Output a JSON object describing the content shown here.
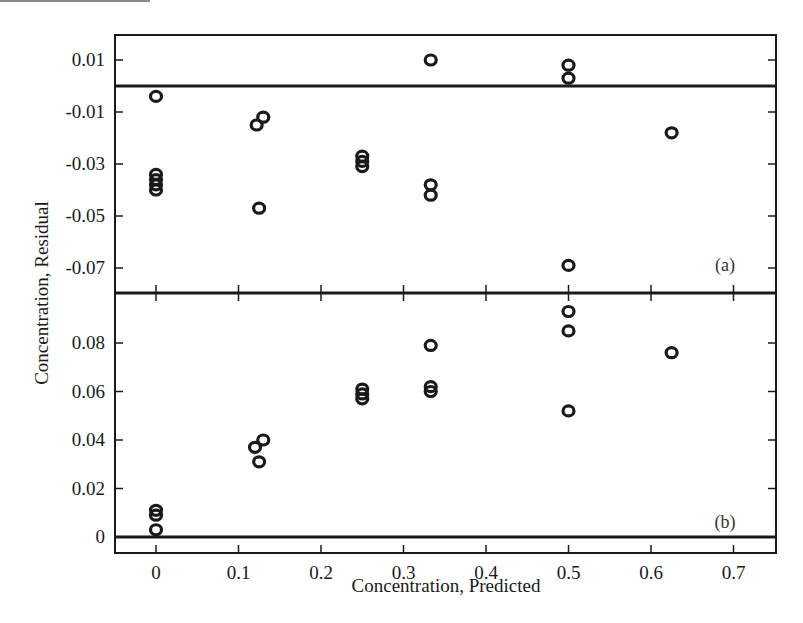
{
  "chart_data": [
    {
      "type": "scatter",
      "panel": "(a)",
      "title": "",
      "xlabel": "Concentration, Predicted",
      "ylabel": "Concentration, Residual",
      "xlim": [
        -0.05,
        0.75
      ],
      "ylim": [
        -0.08,
        0.019
      ],
      "x_ticks": [
        0,
        0.1,
        0.2,
        0.3,
        0.4,
        0.5,
        0.6,
        0.7
      ],
      "y_ticks": [
        0.01,
        -0.01,
        -0.03,
        -0.05,
        -0.07
      ],
      "y_tick_labels": [
        "0.01",
        "-0.01",
        "-0.03",
        "-0.05",
        "-0.07"
      ],
      "reference_line_y": 0,
      "grid": false,
      "marker": "open circle",
      "points": [
        {
          "x": 0,
          "y": -0.004
        },
        {
          "x": 0,
          "y": -0.034
        },
        {
          "x": 0,
          "y": -0.036
        },
        {
          "x": 0,
          "y": -0.038
        },
        {
          "x": 0,
          "y": -0.04
        },
        {
          "x": 0.122,
          "y": -0.015
        },
        {
          "x": 0.13,
          "y": -0.012
        },
        {
          "x": 0.125,
          "y": -0.047
        },
        {
          "x": 0.25,
          "y": -0.027
        },
        {
          "x": 0.25,
          "y": -0.029
        },
        {
          "x": 0.25,
          "y": -0.031
        },
        {
          "x": 0.333,
          "y": 0.01
        },
        {
          "x": 0.333,
          "y": -0.038
        },
        {
          "x": 0.333,
          "y": -0.042
        },
        {
          "x": 0.5,
          "y": 0.008
        },
        {
          "x": 0.5,
          "y": 0.003
        },
        {
          "x": 0.5,
          "y": -0.069
        },
        {
          "x": 0.625,
          "y": -0.018
        }
      ]
    },
    {
      "type": "scatter",
      "panel": "(b)",
      "title": "",
      "xlabel": "Concentration, Predicted",
      "ylabel": "Concentration, Residual",
      "xlim": [
        -0.05,
        0.75
      ],
      "ylim": [
        -0.007,
        0.1
      ],
      "x_ticks": [
        0,
        0.1,
        0.2,
        0.3,
        0.4,
        0.5,
        0.6,
        0.7
      ],
      "x_tick_labels": [
        "0",
        "0.1",
        "0.2",
        "0.3",
        "0.4",
        "0.5",
        "0.6",
        "0.7"
      ],
      "y_ticks": [
        0,
        0.02,
        0.04,
        0.06,
        0.08
      ],
      "y_tick_labels": [
        "0",
        "0.02",
        "0.04",
        "0.06",
        "0.08"
      ],
      "reference_line_y": 0,
      "grid": false,
      "marker": "open circle",
      "points": [
        {
          "x": 0,
          "y": 0.011
        },
        {
          "x": 0,
          "y": 0.009
        },
        {
          "x": 0,
          "y": 0.003
        },
        {
          "x": 0.12,
          "y": 0.037
        },
        {
          "x": 0.13,
          "y": 0.04
        },
        {
          "x": 0.125,
          "y": 0.031
        },
        {
          "x": 0.25,
          "y": 0.061
        },
        {
          "x": 0.25,
          "y": 0.059
        },
        {
          "x": 0.25,
          "y": 0.057
        },
        {
          "x": 0.333,
          "y": 0.079
        },
        {
          "x": 0.333,
          "y": 0.062
        },
        {
          "x": 0.333,
          "y": 0.06
        },
        {
          "x": 0.5,
          "y": 0.093
        },
        {
          "x": 0.5,
          "y": 0.085
        },
        {
          "x": 0.5,
          "y": 0.052
        },
        {
          "x": 0.625,
          "y": 0.076
        }
      ]
    }
  ],
  "labels": {
    "xlabel": "Concentration, Predicted",
    "ylabel": "Concentration, Residual",
    "panel_a": "(a)",
    "panel_b": "(b)"
  },
  "colors": {
    "ink": "#1a1a1a",
    "background": "#ffffff"
  }
}
